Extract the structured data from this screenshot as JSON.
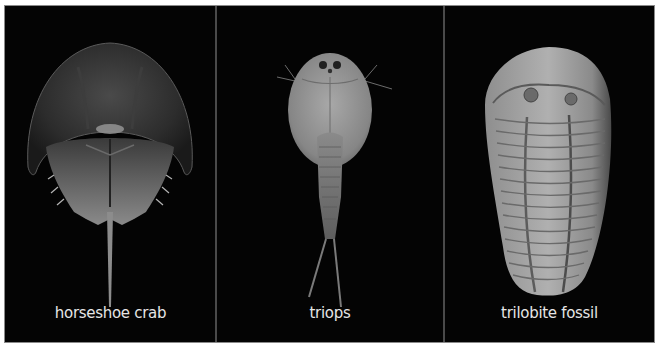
{
  "panels": [
    {
      "id": "horseshoe-crab",
      "label": "horseshoe crab",
      "subject": "horseshoe crab specimen photo (dorsal view)"
    },
    {
      "id": "triops",
      "label": "triops",
      "subject": "triops specimen photo (dorsal view)"
    },
    {
      "id": "trilobite-fossil",
      "label": "trilobite fossil",
      "subject": "trilobite fossil specimen photo"
    }
  ],
  "colors": {
    "background": "#050505",
    "label_text": "#e6e6e6",
    "frame_border": "#8a8a8a",
    "divider": "#4a4a4a"
  }
}
